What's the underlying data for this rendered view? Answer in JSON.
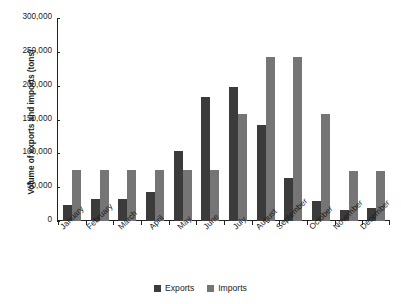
{
  "chart_data": {
    "type": "bar",
    "title": "",
    "xlabel": "",
    "ylabel": "Volume of exports and imports (tons)",
    "ylim": [
      0,
      300000
    ],
    "ytick_labels": [
      "300,000",
      "250,000",
      "200,000",
      "150,000",
      "100,000",
      "50,000",
      "0"
    ],
    "ytick_values": [
      300000,
      250000,
      200000,
      150000,
      100000,
      50000,
      0
    ],
    "grid": false,
    "legend_position": "bottom",
    "categories": [
      "January",
      "February",
      "March",
      "April",
      "May",
      "June",
      "July",
      "August",
      "September",
      "October",
      "November",
      "December"
    ],
    "series": [
      {
        "name": "Exports",
        "color": "#3b3b3b",
        "values": [
          24000,
          32000,
          33000,
          43000,
          104000,
          184000,
          198000,
          142000,
          64000,
          30000,
          17000,
          19000
        ]
      },
      {
        "name": "Imports",
        "color": "#757575",
        "values": [
          75000,
          75000,
          75000,
          75000,
          75000,
          75000,
          158000,
          242000,
          242000,
          158000,
          74000,
          74000
        ]
      }
    ]
  },
  "legend": {
    "items": [
      {
        "label": "Exports",
        "swatch": "exports-swatch"
      },
      {
        "label": "Imports",
        "swatch": "imports-swatch"
      }
    ]
  }
}
